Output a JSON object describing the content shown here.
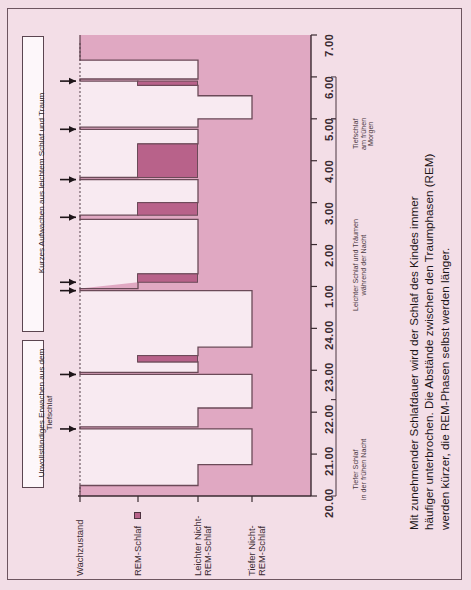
{
  "figure": {
    "background_color": "#f3dee7",
    "plot_fill_dark": "#e0a8c2",
    "plot_fill_light": "#f8eaf1",
    "line_color": "#6b4a58",
    "rem_color": "#b8628a"
  },
  "axis": {
    "time_label": "",
    "time_ticks": [
      "20.00",
      "21.00",
      "22.00",
      "23.00",
      "24.00",
      "1.00",
      "2.00",
      "3.00",
      "4.00",
      "5.00",
      "6.00",
      "7.00"
    ],
    "stage_labels": [
      {
        "id": "awake",
        "label": "Wachzustand",
        "lines": [
          "Wachzustand"
        ],
        "has_legend_swatch": false
      },
      {
        "id": "rem",
        "label": "REM-Schlaf",
        "lines": [
          "REM-Schlaf"
        ],
        "has_legend_swatch": true
      },
      {
        "id": "light-nrem",
        "label": "Leichter Nicht-REM-Schlaf",
        "lines": [
          "Leichter Nicht-",
          "REM-Schlaf"
        ],
        "has_legend_swatch": false
      },
      {
        "id": "deep-nrem",
        "label": "Tiefer Nicht-REM-Schlaf",
        "lines": [
          "Tiefer Nicht-",
          "REM-Schlaf"
        ],
        "has_legend_swatch": false
      }
    ]
  },
  "annotations": {
    "boxes": [
      {
        "id": "light-sleep-wake",
        "text": "Kurzes Aufwachen aus leichtem Schlaf und Traum"
      },
      {
        "id": "deep-sleep-wake",
        "text": "Unvollständiges Erwachen aus dem Tiefschlaf"
      }
    ],
    "arrow_count": 8
  },
  "brackets": [
    {
      "id": "deep-early-night",
      "lines": [
        "Tiefer Schlaf",
        "in der frühen Nacht"
      ],
      "from": "20.00",
      "to": "22.30"
    },
    {
      "id": "light-sleep-dreams",
      "lines": [
        "Leichter Schlaf und Träumen",
        "während der Nacht"
      ],
      "from": "22.30",
      "to": "5.00"
    },
    {
      "id": "deep-early-morning",
      "lines": [
        "Tiefschlaf",
        "am frühen",
        "Morgen"
      ],
      "from": "5.00",
      "to": "6.00"
    }
  ],
  "caption": {
    "lines": [
      "Mit zunehmender Schlafdauer wird der Schlaf des Kindes immer",
      "häufiger unterbrochen. Die Abstände zwischen den Traumphasen (REM)",
      "werden kürzer, die REM-Phasen selbst werden länger."
    ]
  },
  "chart_data": {
    "type": "line",
    "title": "",
    "xlabel": "",
    "ylabel": "",
    "orientation": "rotated-90-ccw",
    "note": "Hypnogram: sleep stage (categorical) vs clock time. Time axis 20.00 -> 7.00.",
    "stage_levels": [
      "Wachzustand",
      "REM-Schlaf",
      "Leichter Nicht-REM-Schlaf",
      "Tiefer Nicht-REM-Schlaf"
    ],
    "time_axis": {
      "start": "20.00",
      "end": "7.00",
      "tick_step_hours": 1,
      "total_hours": 11
    },
    "segments": [
      {
        "from": "20.00",
        "to": "20.25",
        "stage": "Wachzustand"
      },
      {
        "from": "20.25",
        "to": "20.75",
        "stage": "Leichter Nicht-REM-Schlaf"
      },
      {
        "from": "20.75",
        "to": "21.60",
        "stage": "Tiefer Nicht-REM-Schlaf"
      },
      {
        "from": "21.60",
        "to": "21.65",
        "stage": "Wachzustand"
      },
      {
        "from": "21.65",
        "to": "22.10",
        "stage": "Leichter Nicht-REM-Schlaf"
      },
      {
        "from": "22.10",
        "to": "22.90",
        "stage": "Tiefer Nicht-REM-Schlaf"
      },
      {
        "from": "22.90",
        "to": "22.95",
        "stage": "Wachzustand"
      },
      {
        "from": "22.95",
        "to": "23.20",
        "stage": "Leichter Nicht-REM-Schlaf"
      },
      {
        "from": "23.20",
        "to": "23.35",
        "stage": "REM-Schlaf"
      },
      {
        "from": "23.35",
        "to": "23.55",
        "stage": "Leichter Nicht-REM-Schlaf"
      },
      {
        "from": "23.55",
        "to": "24.90",
        "stage": "Tiefer Nicht-REM-Schlaf"
      },
      {
        "from": "24.90",
        "to": "24.95",
        "stage": "Wachzustand"
      },
      {
        "from": "1.10",
        "to": "1.30",
        "stage": "REM-Schlaf"
      },
      {
        "from": "1.30",
        "to": "2.60",
        "stage": "Leichter Nicht-REM-Schlaf"
      },
      {
        "from": "2.60",
        "to": "2.70",
        "stage": "Wachzustand"
      },
      {
        "from": "2.70",
        "to": "3.00",
        "stage": "REM-Schlaf"
      },
      {
        "from": "3.00",
        "to": "3.55",
        "stage": "Leichter Nicht-REM-Schlaf"
      },
      {
        "from": "3.55",
        "to": "3.60",
        "stage": "Wachzustand"
      },
      {
        "from": "3.60",
        "to": "4.40",
        "stage": "REM-Schlaf"
      },
      {
        "from": "4.40",
        "to": "4.75",
        "stage": "Leichter Nicht-REM-Schlaf"
      },
      {
        "from": "4.75",
        "to": "4.80",
        "stage": "Wachzustand"
      },
      {
        "from": "4.80",
        "to": "5.00",
        "stage": "Leichter Nicht-REM-Schlaf"
      },
      {
        "from": "5.00",
        "to": "5.55",
        "stage": "Tiefer Nicht-REM-Schlaf"
      },
      {
        "from": "5.55",
        "to": "5.80",
        "stage": "Leichter Nicht-REM-Schlaf"
      },
      {
        "from": "5.80",
        "to": "5.90",
        "stage": "REM-Schlaf"
      },
      {
        "from": "5.90",
        "to": "5.95",
        "stage": "Wachzustand"
      },
      {
        "from": "5.95",
        "to": "6.40",
        "stage": "Leichter Nicht-REM-Schlaf"
      },
      {
        "from": "6.40",
        "to": "7.00",
        "stage": "Wachzustand"
      }
    ],
    "awakenings": [
      {
        "time": "21.60",
        "type": "Kurzes Aufwachen aus leichtem Schlaf und Traum"
      },
      {
        "time": "22.90",
        "type": "Unvollständiges Erwachen aus dem Tiefschlaf"
      },
      {
        "time": "24.90",
        "type": "Unvollständiges Erwachen aus dem Tiefschlaf"
      },
      {
        "time": "1.10",
        "type": "Kurzes Aufwachen aus leichtem Schlaf und Traum"
      },
      {
        "time": "2.65",
        "type": "Kurzes Aufwachen aus leichtem Schlaf und Traum"
      },
      {
        "time": "3.55",
        "type": "Kurzes Aufwachen aus leichtem Schlaf und Traum"
      },
      {
        "time": "4.75",
        "type": "Kurzes Aufwachen aus leichtem Schlaf und Traum"
      },
      {
        "time": "5.90",
        "type": "Kurzes Aufwachen aus leichtem Schlaf und Traum"
      }
    ]
  }
}
